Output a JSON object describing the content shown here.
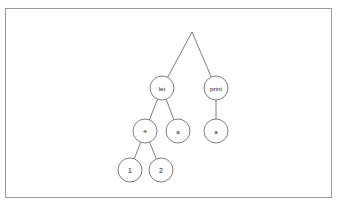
{
  "figure": {
    "kind": "abstract-syntax-tree",
    "caption": "",
    "frame": {
      "x": 5,
      "y": 8,
      "width": 327,
      "height": 190,
      "border_color": "#9a9a9a",
      "background_color": "#ffffff"
    },
    "style": {
      "node_radius": 12,
      "node_fill": "#ffffff",
      "node_stroke": "#5d5d5d",
      "edge_stroke": "#5d5d5d",
      "text_color": "#1a1a1a"
    }
  },
  "chart_data": {
    "type": "diagram",
    "title": "",
    "nodes": [
      {
        "id": "root",
        "label": "",
        "x": 192,
        "y": 32,
        "radius": 0,
        "visible": false,
        "text_class": ""
      },
      {
        "id": "let",
        "label": "let",
        "x": 162,
        "y": 88,
        "radius": 12,
        "visible": true,
        "text_class": ""
      },
      {
        "id": "print",
        "label": "print",
        "x": 216,
        "y": 88,
        "radius": 12,
        "visible": true,
        "text_class": ""
      },
      {
        "id": "plus",
        "label": "+",
        "x": 145,
        "y": 131,
        "radius": 12,
        "visible": true,
        "text_class": "glyph-op"
      },
      {
        "id": "a1",
        "label": "a",
        "x": 178,
        "y": 131,
        "radius": 12,
        "visible": true,
        "text_class": ""
      },
      {
        "id": "a2",
        "label": "a",
        "x": 216,
        "y": 131,
        "radius": 12,
        "visible": true,
        "text_class": ""
      },
      {
        "id": "one",
        "label": "1",
        "x": 130,
        "y": 170,
        "radius": 12,
        "visible": true,
        "text_class": "glyph-num"
      },
      {
        "id": "two",
        "label": "2",
        "x": 161,
        "y": 170,
        "radius": 12,
        "visible": true,
        "text_class": "glyph-num"
      }
    ],
    "edges": [
      {
        "from": "root",
        "to": "let"
      },
      {
        "from": "root",
        "to": "print"
      },
      {
        "from": "let",
        "to": "plus"
      },
      {
        "from": "let",
        "to": "a1"
      },
      {
        "from": "print",
        "to": "a2"
      },
      {
        "from": "plus",
        "to": "one"
      },
      {
        "from": "plus",
        "to": "two"
      }
    ]
  }
}
